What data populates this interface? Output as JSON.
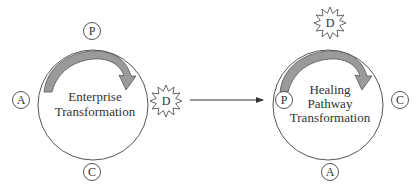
{
  "diagram": {
    "left": {
      "title_lines": [
        "Enterprise",
        "Transformation"
      ],
      "nodes": {
        "top": "P",
        "left": "A",
        "bottom": "C"
      },
      "burst": "D"
    },
    "right": {
      "title_lines": [
        "Healing",
        "Pathway",
        "Transformation"
      ],
      "nodes": {
        "left": "P",
        "right": "C",
        "bottom": "A"
      },
      "burst": "D"
    },
    "colors": {
      "stroke": "#555555",
      "arrow_fill": "#9a9a9a",
      "text": "#333333"
    }
  }
}
